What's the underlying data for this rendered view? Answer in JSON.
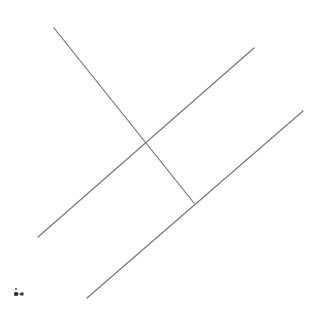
{
  "viewport": {
    "width": 321,
    "height": 312,
    "background": "#ffffff"
  },
  "lines": [
    {
      "id": "line-1",
      "x1": 54,
      "y1": 28,
      "x2": 194,
      "y2": 203,
      "color": "#777777",
      "width": 1.2
    },
    {
      "id": "line-2",
      "x1": 38,
      "y1": 237,
      "x2": 254,
      "y2": 48,
      "color": "#777777",
      "width": 1.2
    },
    {
      "id": "line-3",
      "x1": 87,
      "y1": 298,
      "x2": 303,
      "y2": 111,
      "color": "#777777",
      "width": 1.2
    }
  ],
  "axis_gizmo": {
    "origin": {
      "x": 16,
      "y": 294,
      "color": "#222222"
    },
    "x_marker": {
      "x": 22,
      "y": 294,
      "color": "#333333"
    },
    "y_marker": {
      "x": 16,
      "y": 289,
      "color": "#777777"
    }
  }
}
